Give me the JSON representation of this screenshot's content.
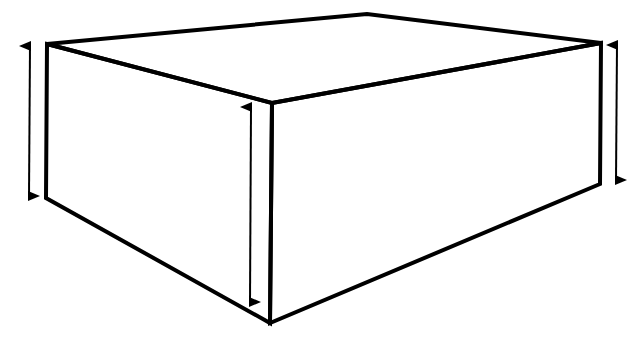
{
  "diagram": {
    "title": "",
    "kind": "3D rectangular box with height dimension arrows",
    "colors": {
      "background": "#ffffff",
      "stroke": "#000000"
    },
    "box": {
      "vertices": {
        "top_left": [
          47,
          44
        ],
        "top_back": [
          367,
          14
        ],
        "top_right": [
          601,
          43
        ],
        "front_top": [
          272,
          103
        ],
        "bottom_left": [
          46,
          198
        ],
        "front_bottom": [
          270,
          323
        ],
        "bottom_right": [
          600,
          184
        ]
      },
      "stroke_width": 4
    },
    "arrows": [
      {
        "id": "left-height-arrow",
        "x1": 30,
        "y1": 46,
        "x2": 29,
        "y2": 196,
        "double": true
      },
      {
        "id": "front-height-arrow",
        "x1": 251,
        "y1": 107,
        "x2": 250,
        "y2": 302,
        "double": true
      },
      {
        "id": "right-height-arrow",
        "x1": 617,
        "y1": 45,
        "x2": 616,
        "y2": 180,
        "double": true
      }
    ]
  }
}
